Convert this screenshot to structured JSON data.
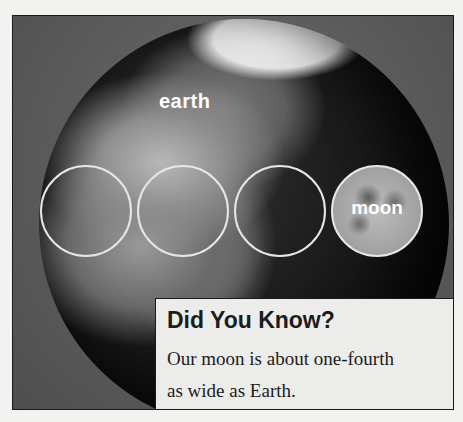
{
  "illustration": {
    "globe_label": "earth",
    "circles": [
      {
        "kind": "earth-size-outline",
        "index": 1
      },
      {
        "kind": "earth-size-outline",
        "index": 2
      },
      {
        "kind": "earth-size-outline",
        "index": 3
      },
      {
        "kind": "moon",
        "label": "moon"
      }
    ],
    "colors": {
      "background": "#f2f2f0",
      "frame": "#5a5a5a",
      "circle_outline": "#e6e6e6",
      "caption_bg": "#ececea",
      "text": "#1c1c1c"
    }
  },
  "caption": {
    "title": "Did You Know?",
    "body_line1": "Our moon is about one-fourth",
    "body_line2": "as wide as Earth."
  }
}
